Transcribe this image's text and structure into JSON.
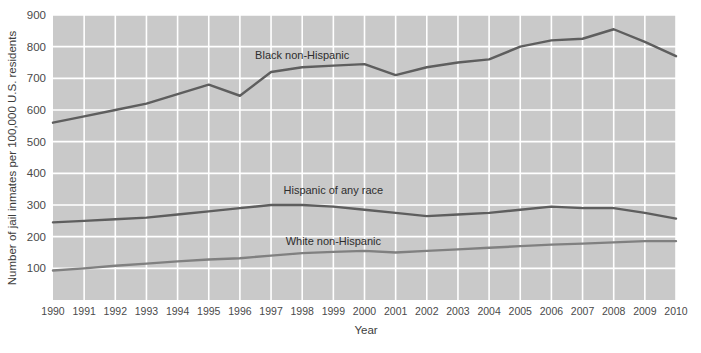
{
  "chart_data": {
    "type": "line",
    "title": "",
    "xlabel": "Year",
    "ylabel": "Number of jail inmates per 100,000 U.S. residents",
    "xlim": [
      1990,
      2010
    ],
    "ylim": [
      0,
      900
    ],
    "ytick_values": [
      100,
      200,
      300,
      400,
      500,
      600,
      700,
      800,
      900
    ],
    "ytick_labels": [
      "100",
      "200",
      "300",
      "400",
      "500",
      "600",
      "700",
      "800",
      "900"
    ],
    "x": [
      1990,
      1991,
      1992,
      1993,
      1994,
      1995,
      1996,
      1997,
      1998,
      1999,
      2000,
      2001,
      2002,
      2003,
      2004,
      2005,
      2006,
      2007,
      2008,
      2009,
      2010
    ],
    "xtick_labels": [
      "1990",
      "1991",
      "1992",
      "1993",
      "1994",
      "1995",
      "1996",
      "1997",
      "1998",
      "1999",
      "2000",
      "2001",
      "2002",
      "2003",
      "2004",
      "2005",
      "2006",
      "2007",
      "2008",
      "2009",
      "2010"
    ],
    "grid": true,
    "gridlines": "horizontal and vertical, white on gray panel",
    "legend_position": "inline labels above each series",
    "plot_background": "#c9c9c9",
    "series": [
      {
        "name": "Black non-Hispanic",
        "color": "#5e5e5e",
        "label_x": 1998,
        "label_y": 760,
        "values": [
          560,
          580,
          600,
          620,
          650,
          680,
          645,
          720,
          735,
          740,
          745,
          710,
          735,
          750,
          760,
          800,
          820,
          825,
          855,
          815,
          770
        ]
      },
      {
        "name": "Hispanic of any race",
        "color": "#5e5e5e",
        "label_x": 1999,
        "label_y": 335,
        "values": [
          245,
          250,
          255,
          260,
          270,
          280,
          290,
          300,
          300,
          295,
          285,
          275,
          265,
          270,
          275,
          285,
          295,
          290,
          290,
          275,
          257
        ]
      },
      {
        "name": "White non-Hispanic",
        "color": "#808080",
        "label_x": 1999,
        "label_y": 175,
        "values": [
          93,
          100,
          108,
          115,
          122,
          128,
          132,
          140,
          148,
          152,
          155,
          150,
          155,
          160,
          165,
          170,
          175,
          178,
          182,
          186,
          186
        ]
      }
    ]
  }
}
